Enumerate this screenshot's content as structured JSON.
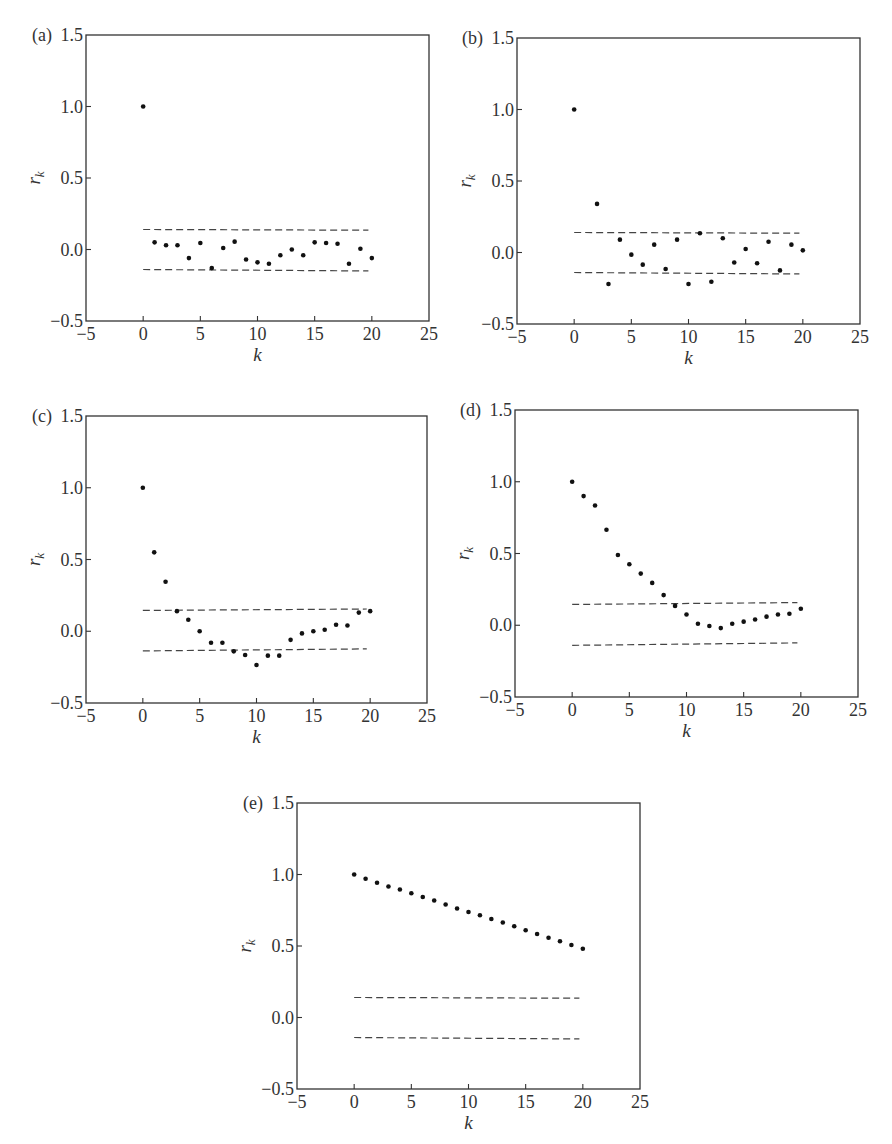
{
  "chart_data": [
    {
      "id": "a",
      "panel_label": "(a)",
      "type": "scatter",
      "title": "",
      "xlabel": "k",
      "ylabel": "r_k",
      "xlim": [
        -5,
        25
      ],
      "ylim": [
        -0.5,
        1.5
      ],
      "xticks": [
        -5,
        0,
        5,
        10,
        15,
        20,
        25
      ],
      "xtick_labels": [
        "−5",
        "0",
        "5",
        "10",
        "15",
        "20",
        "25"
      ],
      "yticks": [
        1.5,
        1.0,
        0.5,
        0.0,
        -0.5
      ],
      "ytick_labels": [
        "1.5",
        "1.0",
        "0.5",
        "0.0",
        "−0.5"
      ],
      "grid": false,
      "confidence_bands": {
        "upper": [
          0.14,
          0.135
        ],
        "lower": [
          -0.14,
          -0.15
        ],
        "x_range": [
          0,
          20
        ]
      },
      "x": [
        0,
        1,
        2,
        3,
        4,
        5,
        6,
        7,
        8,
        9,
        10,
        11,
        12,
        13,
        14,
        15,
        16,
        17,
        18,
        19,
        20
      ],
      "values": [
        1.0,
        0.05,
        0.03,
        0.03,
        -0.06,
        0.045,
        -0.13,
        0.01,
        0.055,
        -0.07,
        -0.09,
        -0.1,
        -0.04,
        0.0,
        -0.04,
        0.05,
        0.045,
        0.04,
        -0.1,
        0.005,
        -0.06
      ]
    },
    {
      "id": "b",
      "panel_label": "(b)",
      "type": "scatter",
      "title": "",
      "xlabel": "k",
      "ylabel": "r_k",
      "xlim": [
        -5,
        25
      ],
      "ylim": [
        -0.5,
        1.5
      ],
      "xticks": [
        -5,
        0,
        5,
        10,
        15,
        20,
        25
      ],
      "xtick_labels": [
        "−5",
        "0",
        "5",
        "10",
        "15",
        "20",
        "25"
      ],
      "yticks": [
        1.5,
        1.0,
        0.5,
        0.0,
        -0.5
      ],
      "ytick_labels": [
        "1.5",
        "1.0",
        "0.5",
        "0.0",
        "−0.5"
      ],
      "grid": false,
      "confidence_bands": {
        "upper": [
          0.14,
          0.135
        ],
        "lower": [
          -0.14,
          -0.15
        ],
        "x_range": [
          0,
          20
        ]
      },
      "x": [
        0,
        2,
        3,
        4,
        5,
        6,
        7,
        8,
        9,
        10,
        11,
        12,
        13,
        14,
        15,
        16,
        17,
        18,
        19,
        20
      ],
      "values": [
        1.0,
        0.34,
        -0.22,
        0.09,
        -0.015,
        -0.085,
        0.055,
        -0.115,
        0.09,
        -0.22,
        0.135,
        -0.205,
        0.1,
        -0.07,
        0.025,
        -0.075,
        0.075,
        -0.125,
        0.055,
        0.015
      ]
    },
    {
      "id": "c",
      "panel_label": "(c)",
      "type": "scatter",
      "title": "",
      "xlabel": "k",
      "ylabel": "r_k",
      "xlim": [
        -5,
        25
      ],
      "ylim": [
        -0.5,
        1.5
      ],
      "xticks": [
        -5,
        0,
        5,
        10,
        15,
        20,
        25
      ],
      "xtick_labels": [
        "−5",
        "0",
        "5",
        "10",
        "15",
        "20",
        "25"
      ],
      "yticks": [
        1.5,
        1.0,
        0.5,
        0.0,
        -0.5
      ],
      "ytick_labels": [
        "1.5",
        "1.0",
        "0.5",
        "0.0",
        "−0.5"
      ],
      "grid": false,
      "confidence_bands": {
        "upper": [
          0.145,
          0.155
        ],
        "lower": [
          -0.137,
          -0.123
        ],
        "x_range": [
          0,
          20
        ]
      },
      "x": [
        0,
        1,
        2,
        3,
        4,
        5,
        6,
        7,
        8,
        9,
        10,
        11,
        12,
        13,
        14,
        15,
        16,
        17,
        18,
        19,
        20
      ],
      "values": [
        1.0,
        0.55,
        0.345,
        0.14,
        0.08,
        0.0,
        -0.08,
        -0.08,
        -0.14,
        -0.165,
        -0.235,
        -0.17,
        -0.17,
        -0.06,
        -0.015,
        0.0,
        0.01,
        0.045,
        0.04,
        0.13,
        0.14
      ]
    },
    {
      "id": "d",
      "panel_label": "(d)",
      "type": "scatter",
      "title": "",
      "xlabel": "k",
      "ylabel": "r_k",
      "xlim": [
        -5,
        25
      ],
      "ylim": [
        -0.5,
        1.5
      ],
      "xticks": [
        -5,
        0,
        5,
        10,
        15,
        20,
        25
      ],
      "xtick_labels": [
        "−5",
        "0",
        "5",
        "10",
        "15",
        "20",
        "25"
      ],
      "yticks": [
        1.5,
        1.0,
        0.5,
        0.0,
        -0.5
      ],
      "ytick_labels": [
        "1.5",
        "1.0",
        "0.5",
        "0.0",
        "−0.5"
      ],
      "grid": false,
      "confidence_bands": {
        "upper": [
          0.145,
          0.158
        ],
        "lower": [
          -0.14,
          -0.123
        ],
        "x_range": [
          0,
          20
        ]
      },
      "x": [
        0,
        1,
        2,
        3,
        4,
        5,
        6,
        7,
        8,
        9,
        10,
        11,
        12,
        13,
        14,
        15,
        16,
        17,
        18,
        19,
        20
      ],
      "values": [
        1.0,
        0.9,
        0.835,
        0.665,
        0.49,
        0.425,
        0.36,
        0.295,
        0.21,
        0.135,
        0.075,
        0.01,
        -0.005,
        -0.02,
        0.01,
        0.025,
        0.04,
        0.06,
        0.075,
        0.08,
        0.115
      ]
    },
    {
      "id": "e",
      "panel_label": "(e)",
      "type": "scatter",
      "title": "",
      "xlabel": "k",
      "ylabel": "r_k",
      "xlim": [
        -5,
        25
      ],
      "ylim": [
        -0.5,
        1.5
      ],
      "xticks": [
        -5,
        0,
        5,
        10,
        15,
        20,
        25
      ],
      "xtick_labels": [
        "−5",
        "0",
        "5",
        "10",
        "15",
        "20",
        "25"
      ],
      "yticks": [
        1.5,
        1.0,
        0.5,
        0.0,
        -0.5
      ],
      "ytick_labels": [
        "1.5",
        "1.0",
        "0.5",
        "0.0",
        "−0.5"
      ],
      "grid": false,
      "confidence_bands": {
        "upper": [
          0.14,
          0.135
        ],
        "lower": [
          -0.14,
          -0.15
        ],
        "x_range": [
          0,
          20
        ]
      },
      "x": [
        0,
        1,
        2,
        3,
        4,
        5,
        6,
        7,
        8,
        9,
        10,
        11,
        12,
        13,
        14,
        15,
        16,
        17,
        18,
        19,
        20
      ],
      "values": [
        1.0,
        0.97,
        0.942,
        0.916,
        0.895,
        0.869,
        0.843,
        0.818,
        0.79,
        0.762,
        0.738,
        0.715,
        0.689,
        0.664,
        0.638,
        0.61,
        0.584,
        0.558,
        0.533,
        0.507,
        0.481
      ]
    }
  ],
  "layout": {
    "panels": {
      "a": {
        "left": 86,
        "top": 35,
        "width": 343,
        "height": 286
      },
      "b": {
        "left": 517,
        "top": 38,
        "width": 343,
        "height": 286
      },
      "c": {
        "left": 86,
        "top": 416,
        "width": 341,
        "height": 287
      },
      "d": {
        "left": 515,
        "top": 410,
        "width": 343,
        "height": 287
      },
      "e": {
        "left": 297,
        "top": 803,
        "width": 343,
        "height": 286
      }
    }
  },
  "labels": {
    "xlabel": "k",
    "ylabel_main": "r",
    "ylabel_sub": "k"
  }
}
